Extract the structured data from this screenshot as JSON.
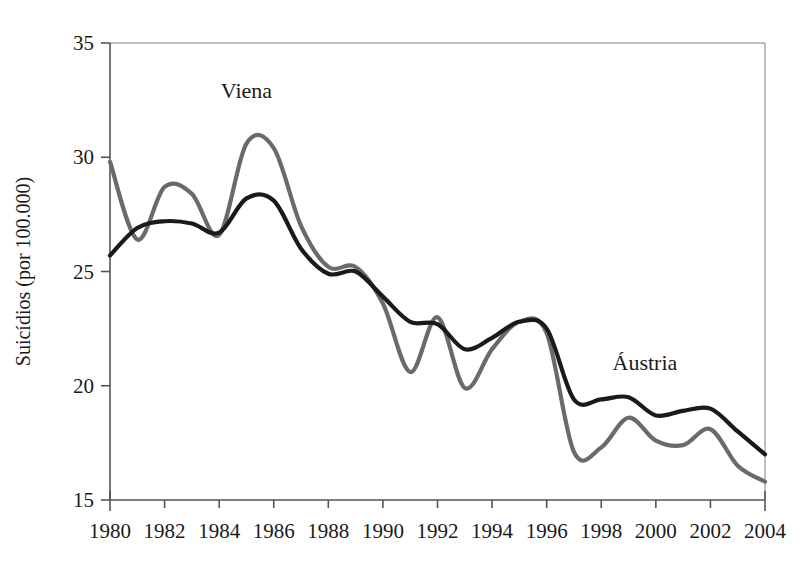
{
  "chart_data": {
    "type": "line",
    "title": "",
    "xlabel": "",
    "ylabel": "Suicídios (por 100.000)",
    "xlim": [
      1980,
      2004
    ],
    "ylim": [
      15,
      35
    ],
    "grid": false,
    "legend_position": "inline-annotations",
    "xticks": [
      1980,
      1982,
      1984,
      1986,
      1988,
      1990,
      1992,
      1994,
      1996,
      1998,
      2000,
      2002,
      2004
    ],
    "xtick_labels": [
      "1980",
      "1982",
      "1984",
      "1986",
      "1988",
      "1990",
      "1992",
      "1994",
      "1996",
      "1998",
      "2000",
      "2002",
      "2004"
    ],
    "yticks": [
      15,
      20,
      25,
      30,
      35
    ],
    "ytick_labels": [
      "15",
      "20",
      "25",
      "30",
      "35"
    ],
    "x": [
      1980,
      1981,
      1982,
      1983,
      1984,
      1985,
      1986,
      1987,
      1988,
      1989,
      1990,
      1991,
      1992,
      1993,
      1994,
      1995,
      1996,
      1997,
      1998,
      1999,
      2000,
      2001,
      2002,
      2003,
      2004
    ],
    "series": [
      {
        "name": "Viena",
        "color": "#6a6a6a",
        "values": [
          29.8,
          26.4,
          28.7,
          28.4,
          26.6,
          30.6,
          30.4,
          27.0,
          25.2,
          25.2,
          23.6,
          20.6,
          23.0,
          19.9,
          21.6,
          22.8,
          22.3,
          17.1,
          17.3,
          18.6,
          17.6,
          17.4,
          18.1,
          16.5,
          15.8
        ],
        "label_x": 1999.5,
        "label_y": 18.6
      },
      {
        "name": "Áustria",
        "color": "#1a1a1a",
        "values": [
          25.7,
          26.9,
          27.2,
          27.1,
          26.7,
          28.2,
          28.1,
          26.0,
          24.9,
          25.0,
          23.9,
          22.8,
          22.7,
          21.6,
          22.1,
          22.8,
          22.5,
          19.4,
          19.4,
          19.5,
          18.7,
          18.9,
          19.0,
          18.0,
          17.0
        ],
        "label_x": 2000.0,
        "label_y": 20.5
      }
    ],
    "annotations": [
      {
        "text": "Viena",
        "x": 1985.0,
        "y": 32.6
      },
      {
        "text": "Áustria",
        "x": 1999.6,
        "y": 20.7
      }
    ]
  },
  "axes": {
    "y_axis_title": "Suicídios (por 100.000)"
  },
  "colors": {
    "viena_line": "#6a6a6a",
    "austria_line": "#1a1a1a",
    "axis": "#555555",
    "background": "#ffffff"
  }
}
